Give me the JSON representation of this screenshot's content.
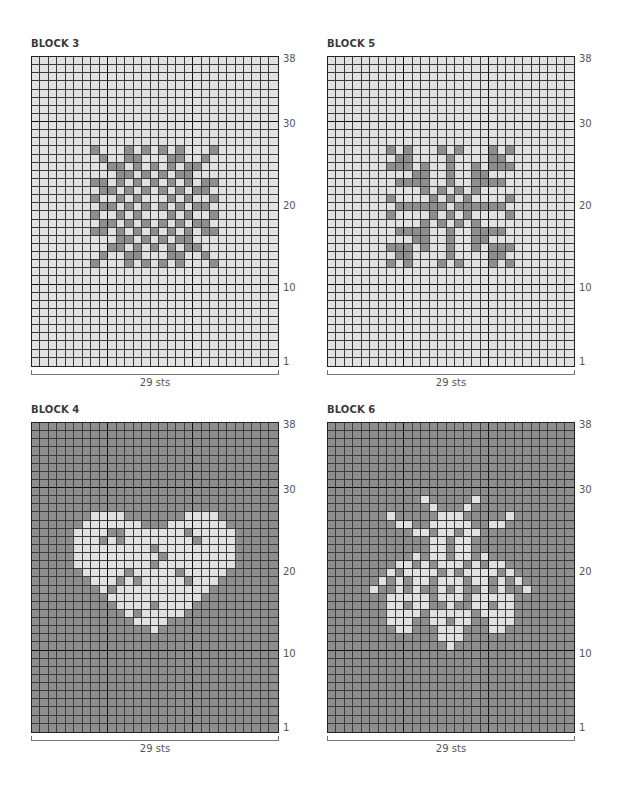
{
  "colors": {
    "light": "#e1e1e1",
    "dark": "#8e8e8e",
    "gridline": "#3c3c3c"
  },
  "chart_data": [
    {
      "type": "heatmap",
      "title": "BLOCK 3",
      "stitches": 29,
      "rows": 38,
      "width_label": "29 sts",
      "row_labels": [
        "38",
        "30",
        "20",
        "10",
        "1"
      ],
      "background": "light",
      "motif_color": "dark",
      "motif": "snowflake",
      "grid_top_row_first": [
        ".............................",
        ".............................",
        ".............................",
        ".............................",
        ".............................",
        ".............................",
        ".............................",
        ".............................",
        ".............................",
        ".............................",
        ".............................",
        ".......#...#.#.#.#...#.......",
        "........#..##...##..#........",
        ".........##.#.#.#.##.........",
        "..........##.#.#.##..........",
        ".......##.#.#.#.#.#.##.......",
        "........##.#.#.#.#.##........",
        ".......#..#.#...#.#..#.......",
        "........##.#.#.#.#.##........",
        ".......#..#.#...#.#..#.......",
        "........##.#.#.#.#.##........",
        ".......##.#.#.#.#.#.##.......",
        "..........##.#.#.##..........",
        ".........##.#.#.#.##.........",
        "........#..##...##..#........",
        ".......#...#.#.#.#...#.......",
        ".............................",
        ".............................",
        ".............................",
        ".............................",
        ".............................",
        ".............................",
        ".............................",
        ".............................",
        ".............................",
        ".............................",
        ".............................",
        "............................."
      ]
    },
    {
      "type": "heatmap",
      "title": "BLOCK 5",
      "stitches": 29,
      "rows": 38,
      "width_label": "29 sts",
      "row_labels": [
        "38",
        "30",
        "20",
        "10",
        "1"
      ],
      "background": "light",
      "motif_color": "dark",
      "motif": "snowflake",
      "grid_top_row_first": [
        ".............................",
        ".............................",
        ".............................",
        ".............................",
        ".............................",
        ".............................",
        ".............................",
        ".............................",
        ".............................",
        ".............................",
        ".............................",
        ".......#.#...#.#...#.#.......",
        "........##....#....##........",
        ".......###.#..#..#.###.......",
        "..........##..#..##..........",
        "........####..#..####........",
        "...........#.#.#.#...........",
        ".......#....#.#.#....#.......",
        "........######.######........",
        ".......#....#.#.#....#.......",
        "...........#.#.#.#...........",
        "........####..#..####........",
        "..........##..#..##..........",
        ".......###.#..#..#.###.......",
        "........##....#....##........",
        ".......#.#...#.#...#.#.......",
        ".............................",
        ".............................",
        ".............................",
        ".............................",
        ".............................",
        ".............................",
        ".............................",
        ".............................",
        ".............................",
        ".............................",
        ".............................",
        "............................."
      ]
    },
    {
      "type": "heatmap",
      "title": "BLOCK 4",
      "stitches": 29,
      "rows": 38,
      "width_label": "29 sts",
      "row_labels": [
        "38",
        "30",
        "20",
        "10",
        "1"
      ],
      "background": "dark",
      "motif_color": "light",
      "motif": "heart",
      "grid_top_row_first": [
        ".............................",
        ".............................",
        ".............................",
        ".............................",
        ".............................",
        ".............................",
        ".............................",
        ".............................",
        ".............................",
        ".............................",
        ".............................",
        ".......####.......####.......",
        "......#######...#######......",
        ".....####..#######.#####.....",
        ".....###.#.########.####.....",
        ".....#########.#########.....",
        ".....##########.########.....",
        ".....#########.#########.....",
        "......#####.#####.#####......",
        ".......###.#.#####.###.......",
        "........#.###########........",
        ".........###########.........",
        "..........####.####..........",
        "...........#.#####...........",
        "............####.............",
        "..............#..............",
        ".............................",
        ".............................",
        ".............................",
        ".............................",
        ".............................",
        ".............................",
        ".............................",
        ".............................",
        ".............................",
        ".............................",
        ".............................",
        "............................."
      ]
    },
    {
      "type": "heatmap",
      "title": "BLOCK 6",
      "stitches": 29,
      "rows": 38,
      "width_label": "29 sts",
      "row_labels": [
        "38",
        "30",
        "20",
        "10",
        "1"
      ],
      "background": "dark",
      "motif_color": "light",
      "motif": "bee",
      "grid_top_row_first": [
        ".............................",
        ".............................",
        ".............................",
        ".............................",
        ".............................",
        ".............................",
        ".............................",
        ".............................",
        ".............................",
        "...........#.....#...........",
        "............#...#............",
        ".......#.....###.....#.......",
        "........##..#####..##........",
        "..........##.##.##...........",
        "............##.##............",
        "............##.##............",
        "..........#.##.##.#..........",
        "........##.#.###.#.##........",
        ".......#.####.#.####.#.......",
        "......#.#.##.###.##.#.#......",
        ".....#..#.#..#.#..#.#..#.....",
        ".......#####.###.#####.......",
        ".......##.##..#..##.##.......",
        ".......####.#####.####.......",
        ".......###..##.##..###.......",
        "........##...###...##........",
        ".............###.............",
        "..............#..............",
        ".............................",
        ".............................",
        ".............................",
        ".............................",
        ".............................",
        ".............................",
        ".............................",
        ".............................",
        ".............................",
        "............................."
      ]
    }
  ]
}
